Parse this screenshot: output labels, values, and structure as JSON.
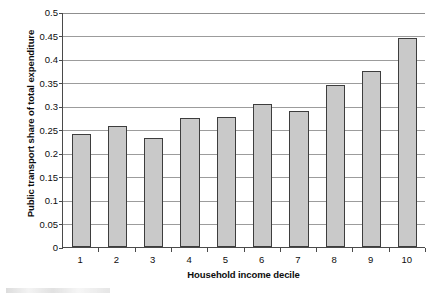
{
  "chart_data": {
    "type": "bar",
    "title": "",
    "xlabel": "Household income decile",
    "ylabel": "Public transport share of total expenditure",
    "categories": [
      "1",
      "2",
      "3",
      "4",
      "5",
      "6",
      "7",
      "8",
      "9",
      "10"
    ],
    "values": [
      0.24,
      0.257,
      0.233,
      0.274,
      0.277,
      0.304,
      0.289,
      0.344,
      0.374,
      0.445
    ],
    "ylim": [
      0,
      0.5
    ],
    "yticks": [
      0,
      0.05,
      0.1,
      0.15,
      0.2,
      0.25,
      0.3,
      0.35,
      0.4,
      0.45,
      0.5
    ],
    "ytick_labels": [
      "0",
      "0.05",
      "0.1",
      "0.15",
      "0.2",
      "0.25",
      "0.3",
      "0.35",
      "0.4",
      "0.45",
      "0.5"
    ],
    "grid": true,
    "grid_axis": "y",
    "legend": false,
    "legend_position": "none",
    "series": [
      {
        "name": "Public transport share of total expenditure",
        "values": [
          0.24,
          0.257,
          0.233,
          0.274,
          0.277,
          0.304,
          0.289,
          0.344,
          0.374,
          0.445
        ]
      }
    ],
    "colors": {
      "bar_fill": "#c9c9c9",
      "bar_border": "#3d3d3d",
      "gridline": "#9c9c9c",
      "axis": "#4a4a4a",
      "text": "#0d0d0d",
      "background": "#ffffff"
    }
  }
}
